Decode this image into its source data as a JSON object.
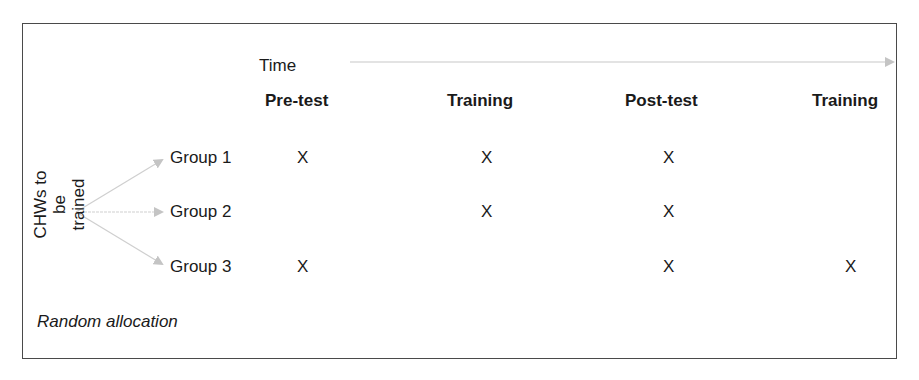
{
  "time_axis": {
    "label": "Time"
  },
  "phases": [
    "Pre-test",
    "Training",
    "Post-test",
    "Training"
  ],
  "source_label": {
    "line1": "CHWs to be",
    "line2": "trained"
  },
  "groups": [
    {
      "label": "Group 1",
      "marks": [
        "X",
        "X",
        "X",
        ""
      ]
    },
    {
      "label": "Group 2",
      "marks": [
        "",
        "X",
        "X",
        ""
      ]
    },
    {
      "label": "Group 3",
      "marks": [
        "X",
        "",
        "X",
        "X"
      ]
    }
  ],
  "footer_note": "Random allocation",
  "colors": {
    "arrow": "#c8c8c8",
    "frame": "#4a4a4a",
    "text": "#1a1a1a"
  }
}
